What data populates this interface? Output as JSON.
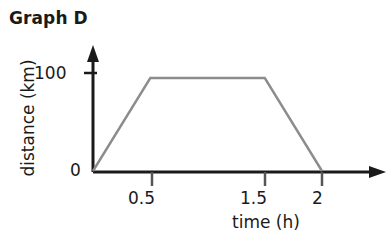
{
  "chart_data": {
    "type": "line",
    "title": "Graph D",
    "xlabel": "time (h)",
    "ylabel": "distance (km)",
    "x": [
      0,
      0.5,
      1.5,
      2
    ],
    "values": [
      0,
      100,
      100,
      0
    ],
    "series": [
      {
        "name": "distance",
        "points": [
          {
            "x": 0,
            "y": 0
          },
          {
            "x": 0.5,
            "y": 100
          },
          {
            "x": 1.5,
            "y": 100
          },
          {
            "x": 2,
            "y": 0
          }
        ]
      }
    ],
    "xlim": [
      0,
      2.3
    ],
    "ylim": [
      0,
      115
    ],
    "xticks": [
      "0.5",
      "1.5",
      "2"
    ],
    "xtick_values": [
      0.5,
      1.5,
      2
    ],
    "yticks": [
      "0",
      "100"
    ],
    "ytick_values": [
      0,
      100
    ],
    "grid": false,
    "legend": false,
    "line_color": "#8c8c8c",
    "axis_color": "#1a1a1a",
    "background": "#ffffff"
  },
  "labels": {
    "title": "Graph D",
    "y_axis": "distance (km)",
    "x_axis": "time (h)",
    "ytick_100": "100",
    "ytick_0": "0",
    "xtick_05": "0.5",
    "xtick_15": "1.5",
    "xtick_2": "2"
  }
}
